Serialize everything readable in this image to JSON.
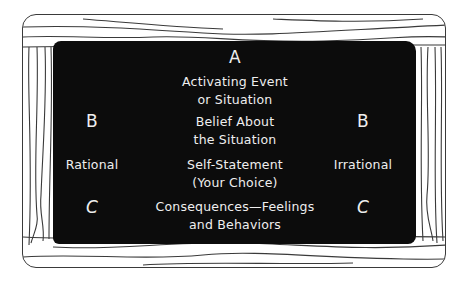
{
  "diagram": {
    "title_letter_a": "A",
    "activating": {
      "line1": "Activating Event",
      "line2": "or Situation"
    },
    "belief": {
      "line1": "Belief About",
      "line2": "the Situation"
    },
    "self_statement": {
      "line1": "Self-Statement",
      "line2": "(Your Choice)"
    },
    "consequences": {
      "line1": "Consequences—Feelings",
      "line2": "and Behaviors"
    },
    "left_column": {
      "b": "B",
      "label": "Rational",
      "c": "C"
    },
    "right_column": {
      "b": "B",
      "label": "Irrational",
      "c": "C"
    }
  },
  "colors": {
    "board": "#0c0c0c",
    "chalk": "#efefef",
    "frame_line": "#3a3a3a",
    "background": "#ffffff"
  }
}
